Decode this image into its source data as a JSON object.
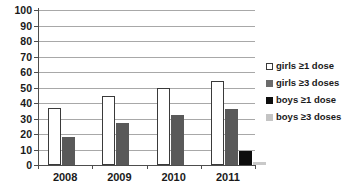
{
  "chart_data": {
    "type": "bar",
    "title": "",
    "xlabel": "",
    "ylabel": "",
    "ylim": [
      0,
      100
    ],
    "ytick_step": 10,
    "grid": true,
    "legend_position": "right",
    "categories": [
      "2008",
      "2009",
      "2010",
      "2011"
    ],
    "ytick_labels": [
      "100",
      "90",
      "80",
      "70",
      "60",
      "50",
      "40",
      "30",
      "20",
      "10",
      "0"
    ],
    "series": [
      {
        "name": "girls ≥1 dose",
        "color": "#ffffff",
        "values": [
          37,
          44.5,
          49.5,
          54
        ]
      },
      {
        "name": "girls ≥3 doses",
        "color": "#595959",
        "values": [
          18,
          27,
          32.5,
          36
        ]
      },
      {
        "name": "boys ≥1 dose",
        "color": "#0d0d0d",
        "values": [
          0,
          0,
          0,
          9
        ]
      },
      {
        "name": "boys ≥3 doses",
        "color": "#c9c9c9",
        "values": [
          0,
          0,
          0,
          2
        ]
      }
    ]
  },
  "legend": {
    "items": [
      {
        "label": "girls ≥1 dose"
      },
      {
        "label": "girls ≥3 doses"
      },
      {
        "label": "boys ≥1 dose"
      },
      {
        "label": "boys ≥3 doses"
      }
    ]
  },
  "colors": {
    "axis": "#4d4d4d",
    "gridline": "#a8a8a8",
    "text": "#1a1a1a",
    "background": "#ffffff"
  }
}
